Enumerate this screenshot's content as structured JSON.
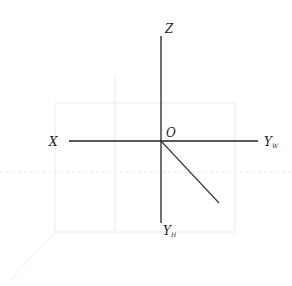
{
  "diagram": {
    "type": "three-projection axis system",
    "origin": {
      "label": "O",
      "x": 161,
      "y": 141
    },
    "axes": [
      {
        "id": "z",
        "label": "Z",
        "subscript": "",
        "from": [
          161,
          141
        ],
        "to": [
          161,
          36
        ]
      },
      {
        "id": "x",
        "label": "X",
        "subscript": "",
        "from": [
          161,
          141
        ],
        "to": [
          69,
          141
        ]
      },
      {
        "id": "yw",
        "label": "Y",
        "subscript": "W",
        "from": [
          161,
          141
        ],
        "to": [
          258,
          141
        ]
      },
      {
        "id": "yh",
        "label": "Y",
        "subscript": "H",
        "from": [
          161,
          141
        ],
        "to": [
          161,
          223
        ]
      },
      {
        "id": "diag",
        "label": "",
        "subscript": "",
        "from": [
          161,
          141
        ],
        "to": [
          219,
          203
        ]
      }
    ],
    "labels": {
      "z": "Z",
      "o": "O",
      "x": "X",
      "yw_main": "Y",
      "yw_sub": "W",
      "yh_main": "Y",
      "yh_sub": "H"
    },
    "colors": {
      "line": "#222222",
      "ghost": "#ececec",
      "background": "#ffffff"
    }
  }
}
